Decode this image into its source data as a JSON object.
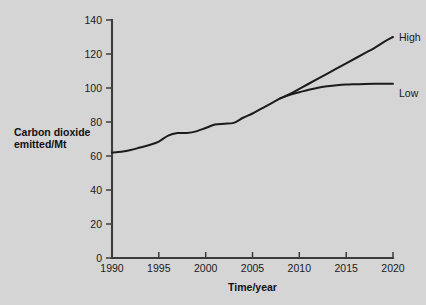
{
  "chart_data": {
    "type": "line",
    "title": "",
    "xlabel": "Time/year",
    "ylabel": "Carbon dioxide emitted/Mt",
    "xlim": [
      1990,
      2020
    ],
    "ylim": [
      0,
      140
    ],
    "xticks": [
      1990,
      1995,
      2000,
      2005,
      2010,
      2015,
      2020
    ],
    "yticks": [
      0,
      20,
      40,
      60,
      80,
      100,
      120,
      140
    ],
    "grid": false,
    "legend_position": "right-inline-end-of-line",
    "x": [
      1990,
      1991,
      1992,
      1993,
      1994,
      1995,
      1996,
      1997,
      1998,
      1999,
      2000,
      2001,
      2002,
      2003,
      2004,
      2005,
      2006,
      2007,
      2008
    ],
    "historical_values": [
      62,
      62.5,
      63.5,
      65,
      66.5,
      68.5,
      72,
      73.5,
      73.5,
      74.5,
      76.5,
      78.5,
      79,
      79.5,
      82.5,
      85,
      88,
      91,
      94
    ],
    "series": [
      {
        "name": "High",
        "label": "High",
        "x": [
          2008,
          2009,
          2010,
          2011,
          2012,
          2013,
          2014,
          2015,
          2016,
          2017,
          2018,
          2019,
          2020
        ],
        "values": [
          94,
          96.5,
          99.5,
          102.5,
          105.5,
          108.5,
          111.5,
          114.5,
          117.5,
          120.5,
          123.5,
          127,
          130
        ]
      },
      {
        "name": "Low",
        "label": "Low",
        "x": [
          2008,
          2009,
          2010,
          2011,
          2012,
          2013,
          2014,
          2015,
          2016,
          2017,
          2018,
          2019,
          2020
        ],
        "values": [
          94,
          96,
          97.5,
          99,
          100.2,
          101,
          101.6,
          102,
          102.2,
          102.4,
          102.5,
          102.5,
          102.5
        ]
      }
    ]
  },
  "axes": {
    "y_title_line1": "Carbon dioxide",
    "y_title_line2": "emitted/Mt",
    "x_title": "Time/year"
  },
  "colors": {
    "background": "#d5d5d5",
    "axis": "#3c3c3c",
    "curve": "#1b1b1b",
    "text": "#1a1a1a"
  }
}
